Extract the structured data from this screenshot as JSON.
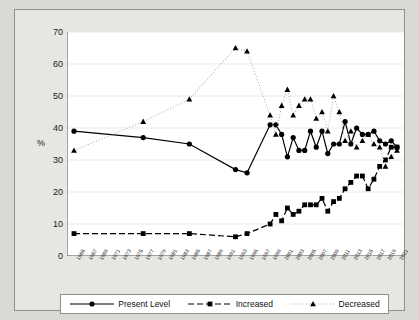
{
  "chart_data": {
    "type": "line",
    "title": "",
    "xlabel": "",
    "ylabel": "%",
    "ylim": [
      0,
      70
    ],
    "yticks": [
      0,
      10,
      20,
      30,
      40,
      50,
      60,
      70
    ],
    "grid": true,
    "legend_position": "bottom",
    "x": [
      1965,
      1966,
      1967,
      1968,
      1969,
      1970,
      1971,
      1972,
      1973,
      1974,
      1975,
      1976,
      1977,
      1978,
      1979,
      1980,
      1981,
      1982,
      1983,
      1984,
      1985,
      1986,
      1987,
      1988,
      1989,
      1990,
      1991,
      1992,
      1993,
      1994,
      1995,
      1996,
      1997,
      1998,
      1999,
      2000,
      2001,
      2002,
      2003,
      2004,
      2005,
      2006,
      2007,
      2008,
      2009,
      2010,
      2011,
      2012,
      2013,
      2014,
      2015,
      2016,
      2017,
      2018,
      2019,
      2020,
      2021
    ],
    "xtick_labels": [
      "1965",
      "1967",
      "1969",
      "1971",
      "1973",
      "1975",
      "1977",
      "1979",
      "1981",
      "1983",
      "1985",
      "1987",
      "1989",
      "1991",
      "1993",
      "1995",
      "1997",
      "1999",
      "2001",
      "2003",
      "2005",
      "2007",
      "2009",
      "2011",
      "2013",
      "2015",
      "2017",
      "2019",
      "2021"
    ],
    "series": [
      {
        "name": "Present Level",
        "marker": "circle",
        "linestyle": "solid",
        "color": "#000000",
        "points": [
          {
            "x": 1965,
            "y": 39
          },
          {
            "x": 1977,
            "y": 37
          },
          {
            "x": 1985,
            "y": 35
          },
          {
            "x": 1993,
            "y": 27
          },
          {
            "x": 1995,
            "y": 26
          },
          {
            "x": 1999,
            "y": 41
          },
          {
            "x": 2000,
            "y": 41
          },
          {
            "x": 2001,
            "y": 38
          },
          {
            "x": 2002,
            "y": 31
          },
          {
            "x": 2003,
            "y": 37
          },
          {
            "x": 2004,
            "y": 33
          },
          {
            "x": 2005,
            "y": 33
          },
          {
            "x": 2006,
            "y": 39
          },
          {
            "x": 2007,
            "y": 34
          },
          {
            "x": 2008,
            "y": 39
          },
          {
            "x": 2009,
            "y": 32
          },
          {
            "x": 2010,
            "y": 35
          },
          {
            "x": 2011,
            "y": 35
          },
          {
            "x": 2012,
            "y": 42
          },
          {
            "x": 2013,
            "y": 35
          },
          {
            "x": 2014,
            "y": 40
          },
          {
            "x": 2015,
            "y": 38
          },
          {
            "x": 2016,
            "y": 38
          },
          {
            "x": 2017,
            "y": 39
          },
          {
            "x": 2018,
            "y": 36
          },
          {
            "x": 2019,
            "y": 35
          },
          {
            "x": 2020,
            "y": 36
          },
          {
            "x": 2021,
            "y": 34
          }
        ]
      },
      {
        "name": "Increased",
        "marker": "square",
        "linestyle": "dashed",
        "color": "#000000",
        "points": [
          {
            "x": 1965,
            "y": 7
          },
          {
            "x": 1977,
            "y": 7
          },
          {
            "x": 1985,
            "y": 7
          },
          {
            "x": 1993,
            "y": 6
          },
          {
            "x": 1995,
            "y": 7
          },
          {
            "x": 1999,
            "y": 10
          },
          {
            "x": 2000,
            "y": 13
          },
          {
            "x": 2001,
            "y": 11
          },
          {
            "x": 2002,
            "y": 15
          },
          {
            "x": 2003,
            "y": 13
          },
          {
            "x": 2004,
            "y": 14
          },
          {
            "x": 2005,
            "y": 16
          },
          {
            "x": 2006,
            "y": 16
          },
          {
            "x": 2007,
            "y": 16
          },
          {
            "x": 2008,
            "y": 18
          },
          {
            "x": 2009,
            "y": 14
          },
          {
            "x": 2010,
            "y": 17
          },
          {
            "x": 2011,
            "y": 18
          },
          {
            "x": 2012,
            "y": 21
          },
          {
            "x": 2013,
            "y": 23
          },
          {
            "x": 2014,
            "y": 25
          },
          {
            "x": 2015,
            "y": 25
          },
          {
            "x": 2016,
            "y": 21
          },
          {
            "x": 2017,
            "y": 24
          },
          {
            "x": 2018,
            "y": 28
          },
          {
            "x": 2019,
            "y": 30
          },
          {
            "x": 2020,
            "y": 34
          },
          {
            "x": 2021,
            "y": 34
          }
        ]
      },
      {
        "name": "Decreased",
        "marker": "triangle",
        "linestyle": "dotted",
        "color": "#000000",
        "points": [
          {
            "x": 1965,
            "y": 33
          },
          {
            "x": 1977,
            "y": 42
          },
          {
            "x": 1985,
            "y": 49
          },
          {
            "x": 1993,
            "y": 65
          },
          {
            "x": 1995,
            "y": 64
          },
          {
            "x": 1999,
            "y": 44
          },
          {
            "x": 2000,
            "y": 38
          },
          {
            "x": 2001,
            "y": 47
          },
          {
            "x": 2002,
            "y": 52
          },
          {
            "x": 2003,
            "y": 44
          },
          {
            "x": 2004,
            "y": 47
          },
          {
            "x": 2005,
            "y": 49
          },
          {
            "x": 2006,
            "y": 49
          },
          {
            "x": 2007,
            "y": 43
          },
          {
            "x": 2008,
            "y": 45
          },
          {
            "x": 2009,
            "y": 39
          },
          {
            "x": 2010,
            "y": 50
          },
          {
            "x": 2011,
            "y": 45
          },
          {
            "x": 2012,
            "y": 36
          },
          {
            "x": 2013,
            "y": 39
          },
          {
            "x": 2014,
            "y": 34
          },
          {
            "x": 2015,
            "y": 36
          },
          {
            "x": 2016,
            "y": 38
          },
          {
            "x": 2017,
            "y": 35
          },
          {
            "x": 2018,
            "y": 34
          },
          {
            "x": 2019,
            "y": 28
          },
          {
            "x": 2020,
            "y": 31
          },
          {
            "x": 2021,
            "y": 33
          }
        ]
      }
    ]
  },
  "legend": {
    "items": [
      {
        "label": "Present Level",
        "marker": "circle",
        "linestyle": "solid"
      },
      {
        "label": "Increased",
        "marker": "square",
        "linestyle": "dashed"
      },
      {
        "label": "Decreased",
        "marker": "triangle",
        "linestyle": "dotted"
      }
    ]
  }
}
